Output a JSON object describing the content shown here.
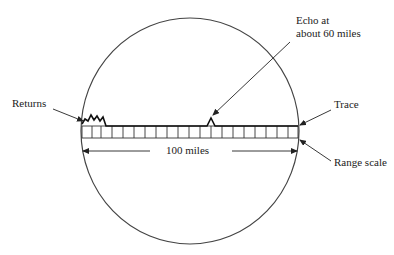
{
  "diagram": {
    "labels": {
      "returns": "Returns",
      "echo_line1": "Echo at",
      "echo_line2": "about 60 miles",
      "trace": "Trace",
      "range_scale": "Range scale",
      "distance": "100 miles"
    },
    "colors": {
      "stroke": "#222222",
      "text": "#222222",
      "background": "#ffffff"
    },
    "scale": {
      "cell_count": 20,
      "range_miles": 100,
      "echo_position_miles": 60
    }
  }
}
